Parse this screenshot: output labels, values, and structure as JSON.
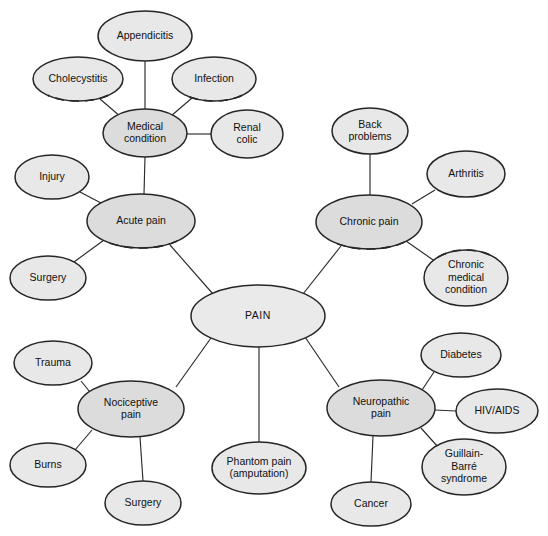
{
  "diagram": {
    "title": "PAIN",
    "type": "concept-map",
    "canvas": {
      "width": 548,
      "height": 536
    },
    "background_color": "#ffffff",
    "colors": {
      "center_fill": "#eaeaea",
      "hub_fill": "#dcdcdc",
      "leaf_fill": "#e8e8e8",
      "node_stroke": "#262626",
      "edge_stroke": "#2b2b2b",
      "text": "#111111"
    }
  },
  "nodes": [
    {
      "id": "pain",
      "label": "PAIN",
      "lines": [
        "PAIN"
      ],
      "role": "center",
      "cx": 258,
      "cy": 316,
      "rx": 67,
      "ry": 31,
      "dashed_edge": "none"
    },
    {
      "id": "acute-pain",
      "label": "Acute pain",
      "lines": [
        "Acute pain"
      ],
      "role": "hub",
      "cx": 141,
      "cy": 221,
      "rx": 54,
      "ry": 27,
      "dashed_edge": "bottom"
    },
    {
      "id": "chronic-pain",
      "label": "Chronic pain",
      "lines": [
        "Chronic pain"
      ],
      "role": "hub",
      "cx": 369,
      "cy": 222,
      "rx": 53,
      "ry": 27,
      "dashed_edge": "bottom"
    },
    {
      "id": "nociceptive-pain",
      "label": "Nociceptive pain",
      "lines": [
        "Nociceptive",
        "pain"
      ],
      "role": "hub",
      "cx": 131,
      "cy": 409,
      "rx": 53,
      "ry": 28,
      "dashed_edge": "none"
    },
    {
      "id": "neuropathic-pain",
      "label": "Neuropathic pain",
      "lines": [
        "Neuropathic",
        "pain"
      ],
      "role": "hub",
      "cx": 381,
      "cy": 408,
      "rx": 54,
      "ry": 28,
      "dashed_edge": "none"
    },
    {
      "id": "medical-condition",
      "label": "Medical condition",
      "lines": [
        "Medical",
        "condition"
      ],
      "role": "hub",
      "cx": 145,
      "cy": 133,
      "rx": 42,
      "ry": 24,
      "dashed_edge": "none"
    },
    {
      "id": "appendicitis",
      "label": "Appendicitis",
      "lines": [
        "Appendicitis"
      ],
      "role": "leaf",
      "cx": 145,
      "cy": 36,
      "rx": 47,
      "ry": 25,
      "dashed_edge": "none"
    },
    {
      "id": "cholecystitis",
      "label": "Cholecystitis",
      "lines": [
        "Cholecystitis"
      ],
      "role": "leaf",
      "cx": 78,
      "cy": 79,
      "rx": 45,
      "ry": 22,
      "dashed_edge": "bottom"
    },
    {
      "id": "infection",
      "label": "Infection",
      "lines": [
        "Infection"
      ],
      "role": "leaf",
      "cx": 214,
      "cy": 79,
      "rx": 42,
      "ry": 22,
      "dashed_edge": "bottom"
    },
    {
      "id": "renal-colic",
      "label": "Renal colic",
      "lines": [
        "Renal",
        "colic"
      ],
      "role": "leaf",
      "cx": 247,
      "cy": 134,
      "rx": 36,
      "ry": 24,
      "dashed_edge": "none"
    },
    {
      "id": "injury",
      "label": "Injury",
      "lines": [
        "Injury"
      ],
      "role": "leaf",
      "cx": 52,
      "cy": 177,
      "rx": 37,
      "ry": 22,
      "dashed_edge": "none"
    },
    {
      "id": "surgery-acute",
      "label": "Surgery",
      "lines": [
        "Surgery"
      ],
      "role": "leaf",
      "cx": 48,
      "cy": 278,
      "rx": 38,
      "ry": 22,
      "dashed_edge": "none"
    },
    {
      "id": "back-problems",
      "label": "Back problems",
      "lines": [
        "Back",
        "problems"
      ],
      "role": "leaf",
      "cx": 370,
      "cy": 131,
      "rx": 38,
      "ry": 23,
      "dashed_edge": "none"
    },
    {
      "id": "arthritis",
      "label": "Arthritis",
      "lines": [
        "Arthritis"
      ],
      "role": "leaf",
      "cx": 466,
      "cy": 174,
      "rx": 39,
      "ry": 23,
      "dashed_edge": "none"
    },
    {
      "id": "chronic-medical-condition",
      "label": "Chronic medical condition",
      "lines": [
        "Chronic",
        "medical",
        "condition"
      ],
      "role": "leaf",
      "cx": 466,
      "cy": 278,
      "rx": 42,
      "ry": 28,
      "dashed_edge": "top"
    },
    {
      "id": "trauma",
      "label": "Trauma",
      "lines": [
        "Trauma"
      ],
      "role": "leaf",
      "cx": 53,
      "cy": 363,
      "rx": 39,
      "ry": 22,
      "dashed_edge": "none"
    },
    {
      "id": "burns",
      "label": "Burns",
      "lines": [
        "Burns"
      ],
      "role": "leaf",
      "cx": 48,
      "cy": 465,
      "rx": 38,
      "ry": 22,
      "dashed_edge": "none"
    },
    {
      "id": "surgery-nociceptive",
      "label": "Surgery",
      "lines": [
        "Surgery"
      ],
      "role": "leaf",
      "cx": 143,
      "cy": 503,
      "rx": 38,
      "ry": 22,
      "dashed_edge": "none"
    },
    {
      "id": "phantom-pain",
      "label": "Phantom pain (amputation)",
      "lines": [
        "Phantom pain",
        "(amputation)"
      ],
      "role": "leaf",
      "cx": 259,
      "cy": 468,
      "rx": 47,
      "ry": 26,
      "dashed_edge": "none"
    },
    {
      "id": "diabetes",
      "label": "Diabetes",
      "lines": [
        "Diabetes"
      ],
      "role": "leaf",
      "cx": 461,
      "cy": 355,
      "rx": 40,
      "ry": 22,
      "dashed_edge": "none"
    },
    {
      "id": "hiv-aids",
      "label": "HIV/AIDS",
      "lines": [
        "HIV/AIDS"
      ],
      "role": "leaf",
      "cx": 497,
      "cy": 411,
      "rx": 41,
      "ry": 22,
      "dashed_edge": "none"
    },
    {
      "id": "guillain-barre-syndrome",
      "label": "Guillain-Barré syndrome",
      "lines": [
        "Guillain-",
        "Barré",
        "syndrome"
      ],
      "role": "leaf",
      "cx": 464,
      "cy": 467,
      "rx": 42,
      "ry": 28,
      "dashed_edge": "none"
    },
    {
      "id": "cancer",
      "label": "Cancer",
      "lines": [
        "Cancer"
      ],
      "role": "leaf",
      "cx": 371,
      "cy": 504,
      "rx": 40,
      "ry": 22,
      "dashed_edge": "none"
    }
  ],
  "edges": [
    {
      "from": "pain",
      "to": "acute-pain",
      "x1": 213,
      "y1": 294,
      "x2": 170,
      "y2": 245
    },
    {
      "from": "pain",
      "to": "chronic-pain",
      "x1": 303,
      "y1": 294,
      "x2": 341,
      "y2": 246
    },
    {
      "from": "pain",
      "to": "nociceptive-pain",
      "x1": 211,
      "y1": 338,
      "x2": 176,
      "y2": 387
    },
    {
      "from": "pain",
      "to": "neuropathic-pain",
      "x1": 305,
      "y1": 337,
      "x2": 339,
      "y2": 387
    },
    {
      "from": "pain",
      "to": "phantom-pain",
      "x1": 259,
      "y1": 347,
      "x2": 259,
      "y2": 442
    },
    {
      "from": "acute-pain",
      "to": "medical-condition",
      "x1": 144,
      "y1": 194,
      "x2": 145,
      "y2": 157
    },
    {
      "from": "acute-pain",
      "to": "injury",
      "x1": 101,
      "y1": 203,
      "x2": 80,
      "y2": 192
    },
    {
      "from": "acute-pain",
      "to": "surgery-acute",
      "x1": 104,
      "y1": 240,
      "x2": 74,
      "y2": 262
    },
    {
      "from": "medical-condition",
      "to": "appendicitis",
      "x1": 145,
      "y1": 109,
      "x2": 145,
      "y2": 61
    },
    {
      "from": "medical-condition",
      "to": "cholecystitis",
      "x1": 121,
      "y1": 117,
      "x2": 100,
      "y2": 99
    },
    {
      "from": "medical-condition",
      "to": "infection",
      "x1": 171,
      "y1": 116,
      "x2": 192,
      "y2": 98
    },
    {
      "from": "medical-condition",
      "to": "renal-colic",
      "x1": 187,
      "y1": 134,
      "x2": 211,
      "y2": 134
    },
    {
      "from": "chronic-pain",
      "to": "back-problems",
      "x1": 370,
      "y1": 195,
      "x2": 370,
      "y2": 154
    },
    {
      "from": "chronic-pain",
      "to": "arthritis",
      "x1": 412,
      "y1": 204,
      "x2": 435,
      "y2": 190
    },
    {
      "from": "chronic-pain",
      "to": "chronic-medical-condition",
      "x1": 406,
      "y1": 241,
      "x2": 436,
      "y2": 262
    },
    {
      "from": "nociceptive-pain",
      "to": "trauma",
      "x1": 90,
      "y1": 392,
      "x2": 81,
      "y2": 381
    },
    {
      "from": "nociceptive-pain",
      "to": "burns",
      "x1": 92,
      "y1": 430,
      "x2": 75,
      "y2": 450
    },
    {
      "from": "nociceptive-pain",
      "to": "surgery-nociceptive",
      "x1": 140,
      "y1": 437,
      "x2": 143,
      "y2": 481
    },
    {
      "from": "neuropathic-pain",
      "to": "diabetes",
      "x1": 422,
      "y1": 390,
      "x2": 434,
      "y2": 372
    },
    {
      "from": "neuropathic-pain",
      "to": "hiv-aids",
      "x1": 435,
      "y1": 410,
      "x2": 456,
      "y2": 411
    },
    {
      "from": "neuropathic-pain",
      "to": "guillain-barre-syndrome",
      "x1": 421,
      "y1": 428,
      "x2": 438,
      "y2": 447
    },
    {
      "from": "neuropathic-pain",
      "to": "cancer",
      "x1": 373,
      "y1": 436,
      "x2": 371,
      "y2": 482
    }
  ]
}
